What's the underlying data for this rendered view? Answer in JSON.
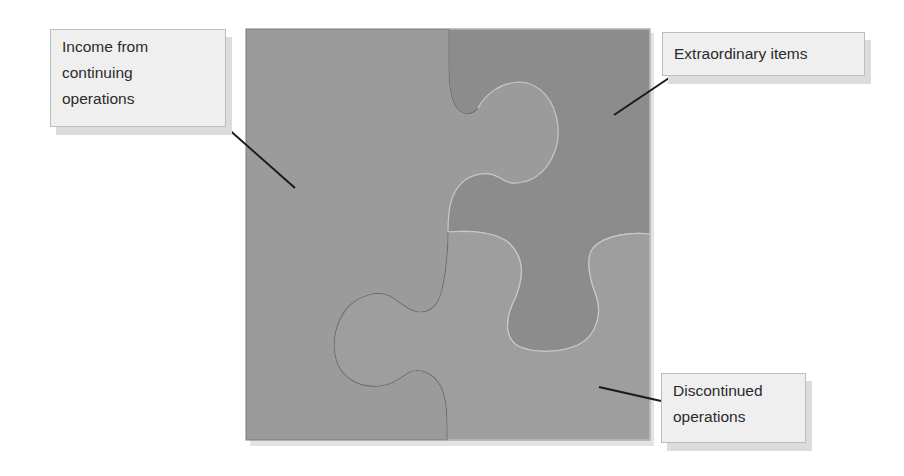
{
  "diagram": {
    "type": "jigsaw-puzzle",
    "pieces": 3,
    "colors": {
      "background": "#ffffff",
      "piece_light": "#9a9a9a",
      "piece_dark": "#8a8a8a",
      "seam": "#c8c8c8",
      "callout_fill": "#efefef",
      "callout_border": "#bdbdbd",
      "leader_line": "#1a1a1a"
    }
  },
  "labels": {
    "income": {
      "line1": "Income from",
      "line2": "continuing",
      "line3": "operations"
    },
    "extraordinary": {
      "line1": "Extraordinary items"
    },
    "discontinued": {
      "line1": "Discontinued",
      "line2": "operations"
    }
  }
}
